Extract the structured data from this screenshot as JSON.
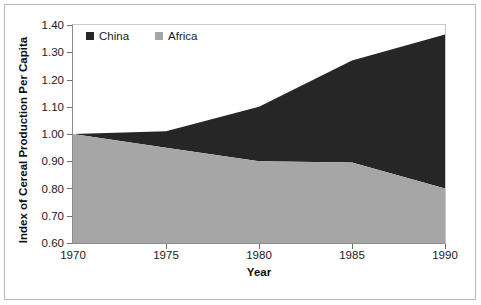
{
  "chart_data": {
    "type": "area",
    "stacked": true,
    "title": "",
    "xlabel": "Year",
    "ylabel": "Index of Cereal Production Per Capita",
    "x": [
      1970,
      1975,
      1980,
      1985,
      1990
    ],
    "xtick_labels": [
      "1970",
      "1975",
      "1980",
      "1985",
      "1990"
    ],
    "ytick_labels": [
      "0.60",
      "0.70",
      "0.80",
      "0.90",
      "1.00",
      "1.10",
      "1.20",
      "1.30",
      "1.40"
    ],
    "ytick_values": [
      0.6,
      0.7,
      0.8,
      0.9,
      1.0,
      1.1,
      1.2,
      1.3,
      1.4
    ],
    "xlim": [
      1970,
      1990
    ],
    "ylim": [
      0.6,
      1.4
    ],
    "grid": false,
    "legend_position": "top-left-inside",
    "series": [
      {
        "name": "China",
        "color": "#262626",
        "stack_order": 2,
        "values": [
          0.0,
          0.06,
          0.2,
          0.375,
          0.565
        ],
        "cumulative_top": [
          1.0,
          1.01,
          1.1,
          1.27,
          1.365
        ]
      },
      {
        "name": "Africa",
        "color": "#a6a6a6",
        "stack_order": 1,
        "values": [
          1.0,
          0.95,
          0.9,
          0.895,
          0.8
        ],
        "cumulative_top": [
          1.0,
          0.95,
          0.9,
          0.895,
          0.8
        ]
      }
    ]
  },
  "legend": {
    "entries": [
      {
        "label": "China",
        "color": "#262626",
        "marker": "square-swatch-icon"
      },
      {
        "label": "Africa",
        "color": "#a6a6a6",
        "marker": "square-swatch-icon"
      }
    ]
  },
  "axes": {
    "y_title": "Index of Cereal Production Per Capita",
    "x_title": "Year"
  },
  "colors": {
    "china": "#262626",
    "africa": "#a6a6a6",
    "axis": "#8d8d8d",
    "frame": "#b9b9b9",
    "text": "#1a1a1a",
    "background": "#ffffff"
  }
}
